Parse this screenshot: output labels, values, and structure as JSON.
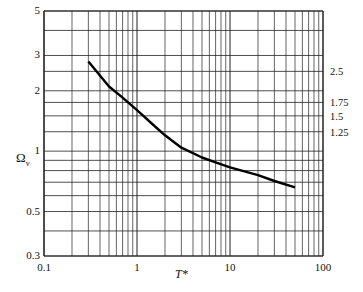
{
  "chart_data": {
    "type": "line",
    "title": "",
    "xlabel": "T*",
    "ylabel": "Ω_v",
    "xscale": "log",
    "yscale": "log",
    "xlim": [
      0.1,
      100
    ],
    "ylim": [
      0.3,
      5
    ],
    "grid": true,
    "x_ticks": [
      "0.1",
      "1",
      "10",
      "100"
    ],
    "y_ticks": [
      "0.3",
      "0.5",
      "1",
      "2",
      "3",
      "5"
    ],
    "right_ticks": [
      "2.5",
      "1.75",
      "1.5",
      "1.25"
    ],
    "series": [
      {
        "name": "Ω_v",
        "x": [
          0.3,
          0.5,
          0.7,
          1.0,
          1.5,
          2.0,
          3.0,
          5.0,
          7.0,
          10,
          20,
          30,
          50
        ],
        "y": [
          2.8,
          2.1,
          1.85,
          1.6,
          1.35,
          1.2,
          1.04,
          0.93,
          0.88,
          0.83,
          0.76,
          0.71,
          0.66
        ]
      }
    ]
  },
  "labels": {
    "xlabel": "T*",
    "ylabel_main": "Ω",
    "ylabel_sub": "v",
    "y_ticks": [
      {
        "text": "5",
        "v": 5
      },
      {
        "text": "3",
        "v": 3
      },
      {
        "text": "2",
        "v": 2
      },
      {
        "text": "1",
        "v": 1
      },
      {
        "text": "0.5",
        "v": 0.5
      },
      {
        "text": "0.3",
        "v": 0.3
      }
    ],
    "x_ticks": [
      {
        "text": "0.1",
        "v": 0.1
      },
      {
        "text": "1",
        "v": 1
      },
      {
        "text": "10",
        "v": 10
      },
      {
        "text": "100",
        "v": 100
      }
    ],
    "right_ticks": [
      {
        "text": "2.5",
        "v": 2.5
      },
      {
        "text": "1.75",
        "v": 1.75
      },
      {
        "text": "1.5",
        "v": 1.5
      },
      {
        "text": "1.25",
        "v": 1.25
      }
    ]
  }
}
